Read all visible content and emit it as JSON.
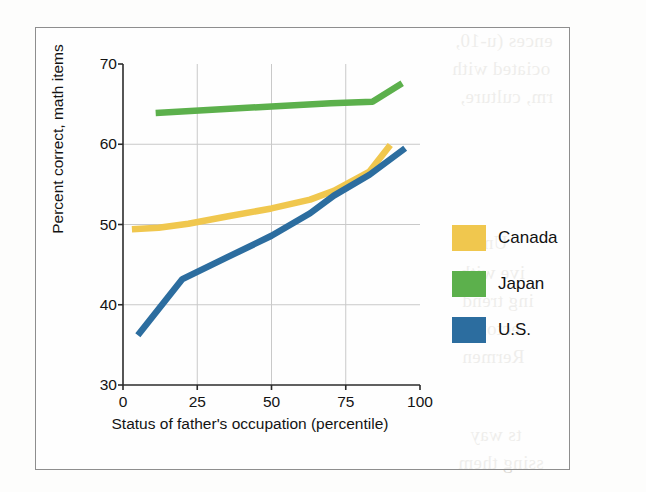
{
  "figure": {
    "frame_border_color": "#8e8e8e",
    "background_color": "#ffffff"
  },
  "chart_data": {
    "type": "line",
    "title": "",
    "xlabel": "Status of father's occupation (percentile)",
    "ylabel": "Percent correct, math items",
    "xlim": [
      0,
      100
    ],
    "ylim": [
      30,
      70
    ],
    "xticks": [
      0,
      25,
      50,
      75,
      100
    ],
    "yticks": [
      30,
      40,
      50,
      60,
      70
    ],
    "xtick_labels": [
      "0",
      "25",
      "50",
      "75",
      "100"
    ],
    "ytick_labels": [
      "30",
      "40",
      "50",
      "60",
      "70"
    ],
    "grid": "both",
    "gridlines_x": [
      25,
      50,
      75
    ],
    "gridlines_y": [
      40,
      50,
      60
    ],
    "grid_color": "#c9c9c9",
    "axis_color": "#2b2b2b",
    "legend_position": "right",
    "series": [
      {
        "name": "Canada",
        "color": "#f0c74e",
        "x": [
          3,
          12,
          22,
          35,
          50,
          63,
          71,
          83,
          90
        ],
        "y": [
          49.4,
          49.6,
          50.1,
          51.0,
          52.0,
          53.1,
          54.2,
          56.6,
          59.9
        ]
      },
      {
        "name": "Japan",
        "color": "#5cb04c",
        "x": [
          11,
          30,
          50,
          70,
          84,
          94
        ],
        "y": [
          63.9,
          64.3,
          64.7,
          65.1,
          65.3,
          67.6
        ]
      },
      {
        "name": "U.S.",
        "color": "#2c6d9f",
        "x": [
          5,
          20,
          35,
          50,
          63,
          71,
          83,
          95
        ],
        "y": [
          36.2,
          43.2,
          45.9,
          48.6,
          51.4,
          53.6,
          56.2,
          59.5
        ]
      }
    ]
  },
  "legend": {
    "items": [
      {
        "label": "Canada",
        "color": "#f0c74e"
      },
      {
        "label": "Japan",
        "color": "#5cb04c"
      },
      {
        "label": "U.S.",
        "color": "#2c6d9f"
      }
    ]
  },
  "bleed_through": {
    "note": "faint mirrored text showing through from the reverse page",
    "lines": [
      {
        "text": "ences (u-10,",
        "left": 455,
        "top": 30,
        "size": 19
      },
      {
        "text": "ociated with",
        "left": 452,
        "top": 58,
        "size": 19
      },
      {
        "text": "rm, culture,",
        "left": 460,
        "top": 86,
        "size": 19
      },
      {
        "text": "Unio",
        "left": 468,
        "top": 232,
        "size": 19
      },
      {
        "text": "ive with",
        "left": 460,
        "top": 262,
        "size": 19
      },
      {
        "text": "ing trend",
        "left": 462,
        "top": 290,
        "size": 19
      },
      {
        "text": "ectory",
        "left": 470,
        "top": 318,
        "size": 19
      },
      {
        "text": "Rermen",
        "left": 462,
        "top": 346,
        "size": 19
      },
      {
        "text": "ts way",
        "left": 470,
        "top": 424,
        "size": 19
      },
      {
        "text": "ssing them",
        "left": 458,
        "top": 452,
        "size": 19
      }
    ]
  }
}
